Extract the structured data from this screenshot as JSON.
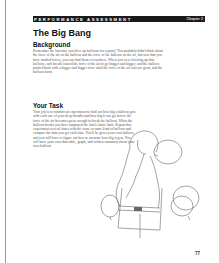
{
  "header": {
    "section_label": "PERFORMANCE ASSESSMENT",
    "chapter_label": "Chapter 2"
  },
  "title": "The Big Bang",
  "background": {
    "heading": "Background",
    "text": "Remember the last time you blew up balloons for a party? You probably didn't think about the force of the air on the balloon and the force of the balloon on the air, but now that you have studied forces, you can find them everywhere. When you were blowing up that balloon, each breath caused the force of the air to get bigger and bigger, and the balloon pushed back with a bigger and bigger force until the force of the air was too great, and the balloon burst."
  },
  "task": {
    "heading": "Your Task",
    "text": "Your job is to conduct an experiment to find out how big a balloon gets with each one of your deep breaths and how big it can get before the force of the air becomes great enough to break the balloon. When the balloon breaks you have surpassed the final elastic limit. Repeat this experiment several times with the same or same kind of balloon and compare the data you get each time. You'll be given your own balloon, and you will have to figure out how to measure how big it gets. You will have your own data table, graph, and written summary about your own balloon."
  },
  "illustration": {
    "description": "girl-blowing-up-balloon-with-two-balloons"
  },
  "page_number": "77"
}
